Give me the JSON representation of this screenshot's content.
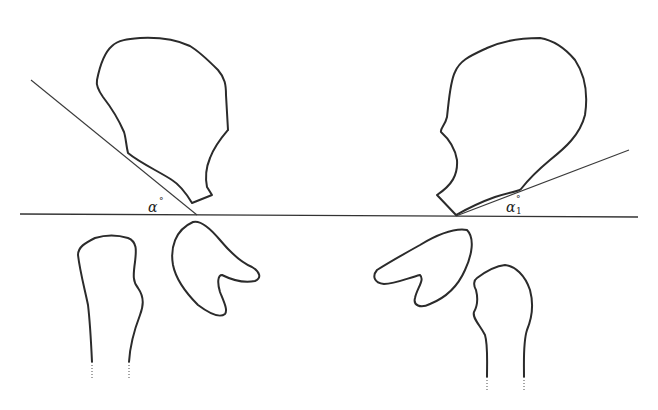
{
  "diagram": {
    "labels": {
      "left_angle": "α",
      "left_degree": "°",
      "right_angle": "α",
      "right_subscript": "1",
      "right_degree": "°"
    },
    "stroke_color": "#2b2b2b",
    "background": "#ffffff"
  }
}
